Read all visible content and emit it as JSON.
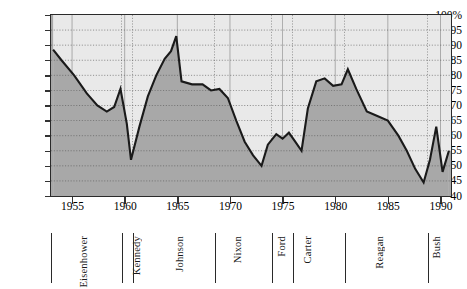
{
  "chart_data": {
    "type": "area",
    "title": "",
    "xlabel": "",
    "ylabel": "",
    "xlim": [
      1953,
      1991
    ],
    "ylim": [
      40,
      100
    ],
    "ytick_labels": [
      "100%",
      "95",
      "90",
      "85",
      "80",
      "75",
      "70",
      "65",
      "60",
      "55",
      "50",
      "45",
      "40"
    ],
    "ytick_values": [
      100,
      95,
      90,
      85,
      80,
      75,
      70,
      65,
      60,
      55,
      50,
      45,
      40
    ],
    "xtick_labels": [
      "1955",
      "1960",
      "1965",
      "1970",
      "1975",
      "1980",
      "1985",
      "1990"
    ],
    "xtick_values": [
      1955,
      1960,
      1965,
      1970,
      1975,
      1980,
      1985,
      1990
    ],
    "grid": "dotted-horizontal-and-vertical",
    "legend": "none",
    "series": [
      {
        "name": "value",
        "x": [
          1953.2,
          1954.0,
          1955.2,
          1956.4,
          1957.4,
          1958.3,
          1959.0,
          1959.6,
          1960.2,
          1960.6,
          1961.4,
          1962.2,
          1963.0,
          1963.8,
          1964.4,
          1964.9,
          1965.4,
          1966.4,
          1967.4,
          1968.2,
          1969.0,
          1969.8,
          1970.6,
          1971.4,
          1972.2,
          1973.0,
          1973.6,
          1974.4,
          1975.0,
          1975.6,
          1976.2,
          1976.8,
          1977.4,
          1978.2,
          1979.0,
          1979.8,
          1980.6,
          1981.2,
          1982.0,
          1983.0,
          1984.0,
          1985.0,
          1986.0,
          1986.8,
          1987.6,
          1988.4,
          1989.0,
          1989.6,
          1990.2,
          1990.8
        ],
        "y": [
          88.5,
          85.0,
          80.0,
          74.0,
          70.0,
          68.0,
          69.5,
          75.5,
          64.0,
          52.0,
          63.0,
          73.0,
          80.0,
          85.5,
          88.0,
          93.0,
          78.0,
          77.0,
          77.0,
          75.0,
          75.5,
          72.5,
          65.0,
          58.0,
          53.5,
          50.0,
          57.0,
          60.5,
          59.0,
          61.0,
          58.0,
          55.0,
          69.0,
          78.0,
          79.0,
          76.5,
          77.0,
          82.0,
          75.5,
          68.0,
          66.5,
          65.0,
          60.0,
          55.0,
          49.0,
          44.5,
          52.0,
          63.0,
          48.0,
          55.0
        ]
      }
    ]
  },
  "presidents": [
    {
      "label": "Eisenhower",
      "start_x": 51,
      "label_x": 84
    },
    {
      "label": "Kennedy",
      "start_x": 122,
      "label_x": 137
    },
    {
      "label": "Johnson",
      "start_x": 133,
      "label_x": 180
    },
    {
      "label": "Nixon",
      "start_x": 215,
      "label_x": 238
    },
    {
      "label": "Ford",
      "start_x": 272,
      "label_x": 282
    },
    {
      "label": "Carter",
      "start_x": 293,
      "label_x": 308
    },
    {
      "label": "Reagan",
      "start_x": 345,
      "label_x": 380
    },
    {
      "label": "Bush",
      "start_x": 428,
      "label_x": 437
    }
  ],
  "colors": {
    "area_below": "#a8a8a8",
    "area_above": "#e9e9e9",
    "line": "#1a1a1a",
    "axis": "#2a2a2a",
    "grid": "#8d8d8d"
  }
}
